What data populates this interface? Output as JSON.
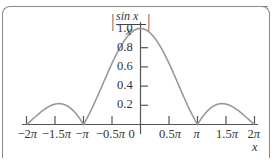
{
  "chart_data": {
    "type": "line",
    "title": "",
    "function": "|sin x / x|",
    "xlabel": "x",
    "ylabel": "|sin x / x|",
    "ylabel_parts": {
      "num": "sin x",
      "den": "x"
    },
    "xlim": [
      -6.2832,
      6.2832
    ],
    "ylim": [
      0,
      1.0
    ],
    "grid": false,
    "legend": null,
    "x_ticks": [
      "−2π",
      "−1.5π",
      "−π",
      "−0.5π",
      "0",
      "0.5π",
      "π",
      "1.5π",
      "2π"
    ],
    "y_ticks": [
      "0.2",
      "0.4",
      "0.6",
      "0.8",
      "1.0"
    ],
    "series": [
      {
        "name": "|sin x / x|",
        "x": [
          -6.283,
          -5.5,
          -4.712,
          -4.0,
          -3.142,
          -2.5,
          -1.571,
          -0.8,
          0,
          0.8,
          1.571,
          2.5,
          3.142,
          4.0,
          4.712,
          5.5,
          6.283
        ],
        "values": [
          0.0,
          0.128,
          0.212,
          0.189,
          0.0,
          0.239,
          0.637,
          0.897,
          1.0,
          0.897,
          0.637,
          0.239,
          0.0,
          0.189,
          0.212,
          0.128,
          0.0
        ]
      }
    ]
  }
}
